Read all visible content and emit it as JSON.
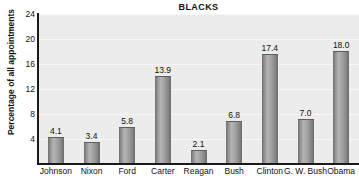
{
  "chart_data": {
    "type": "bar",
    "title": "BLACKS",
    "xlabel": "",
    "ylabel": "Percentage of all appointments",
    "categories": [
      "Johnson",
      "Nixon",
      "Ford",
      "Carter",
      "Reagan",
      "Bush",
      "Clinton",
      "G. W. Bush",
      "Obama"
    ],
    "values": [
      4.1,
      3.4,
      5.8,
      13.9,
      2.1,
      6.8,
      17.4,
      7.0,
      18.0
    ],
    "value_labels": [
      "4.1",
      "3.4",
      "5.8",
      "13.9",
      "2.1",
      "6.8",
      "17.4",
      "7.0",
      "18.0"
    ],
    "ylim": [
      0,
      24
    ],
    "yticks": [
      4,
      8,
      12,
      16,
      20,
      24
    ],
    "ytick_labels": [
      "4",
      "8",
      "12",
      "16",
      "20",
      "24"
    ],
    "grid": true,
    "legend": false,
    "colors": {
      "plot_background": "#ececec",
      "gridline": "#f7f7f7",
      "axis": "#1a1a1a",
      "bar_light": "#b4b4b4",
      "bar_dark": "#6a6a6a",
      "text": "#111111",
      "page_background": "#ffffff"
    }
  }
}
